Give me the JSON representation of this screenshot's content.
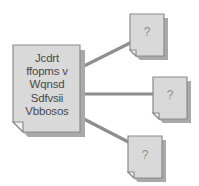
{
  "diagram": {
    "colors": {
      "doc_fill": "#d9d9d9",
      "doc_stroke": "#8c8c8c",
      "doc_shadow": "#a8a8a8",
      "fold_fill": "#eeeeee",
      "connector": "#8e8e8e",
      "text": "#4a4a4a",
      "question_text": "#8e8e8e",
      "background": "#ffffff"
    },
    "source_document": {
      "name": "source-document",
      "icon": "document-icon",
      "lines": [
        "Jcdrt",
        "ffopms v",
        "Wqnsd",
        "Sdfvsii",
        "Vbbosos"
      ]
    },
    "target_documents": [
      {
        "name": "unknown-document-top",
        "icon": "document-icon",
        "label": "?"
      },
      {
        "name": "unknown-document-middle",
        "icon": "document-icon",
        "label": "?"
      },
      {
        "name": "unknown-document-bottom",
        "icon": "document-icon",
        "label": "?"
      }
    ],
    "connectors": [
      {
        "name": "connector-top",
        "from": "source-document",
        "to": "unknown-document-top"
      },
      {
        "name": "connector-middle",
        "from": "source-document",
        "to": "unknown-document-middle"
      },
      {
        "name": "connector-bottom",
        "from": "source-document",
        "to": "unknown-document-bottom"
      }
    ]
  }
}
